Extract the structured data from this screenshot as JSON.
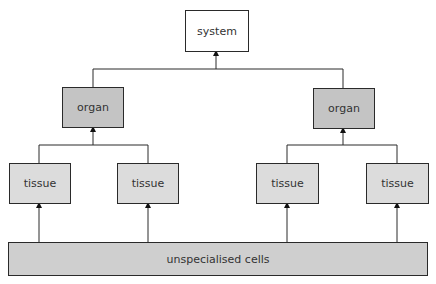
{
  "diagram": {
    "nodes": {
      "system": "system",
      "organ_left": "organ",
      "organ_right": "organ",
      "tissue_1": "tissue",
      "tissue_2": "tissue",
      "tissue_3": "tissue",
      "tissue_4": "tissue",
      "cells": "unspecialised cells"
    },
    "edges": [
      [
        "cells",
        "tissue_1"
      ],
      [
        "cells",
        "tissue_2"
      ],
      [
        "cells",
        "tissue_3"
      ],
      [
        "cells",
        "tissue_4"
      ],
      [
        "tissue_1",
        "organ_left"
      ],
      [
        "tissue_2",
        "organ_left"
      ],
      [
        "tissue_3",
        "organ_right"
      ],
      [
        "tissue_4",
        "organ_right"
      ],
      [
        "organ_left",
        "system"
      ],
      [
        "organ_right",
        "system"
      ]
    ],
    "colors": {
      "system": "#ffffff",
      "organ": "#c4c4c4",
      "tissue": "#dcdcdc",
      "cells": "#cfcfcf",
      "line": "#2a2a2a"
    }
  }
}
